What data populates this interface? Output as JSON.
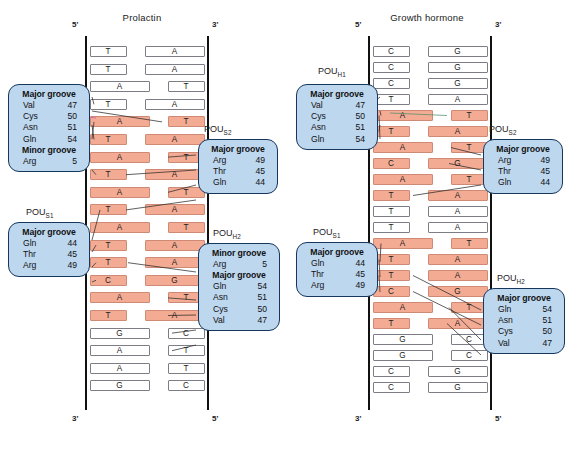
{
  "figure": {
    "panels": [
      {
        "id": "prolactin",
        "title": "Prolactin",
        "top_left_end": "5'",
        "top_right_end": "3'",
        "bottom_left_end": "3'",
        "bottom_right_end": "5'",
        "pairs": [
          {
            "left": "T",
            "right": "A",
            "highlight": false
          },
          {
            "left": "T",
            "right": "A",
            "highlight": false
          },
          {
            "left": "A",
            "right": "T",
            "highlight": false
          },
          {
            "left": "T",
            "right": "A",
            "highlight": false
          },
          {
            "left": "A",
            "right": "T",
            "highlight": true
          },
          {
            "left": "T",
            "right": "A",
            "highlight": true
          },
          {
            "left": "A",
            "right": "T",
            "highlight": true
          },
          {
            "left": "T",
            "right": "A",
            "highlight": true
          },
          {
            "left": "A",
            "right": "T",
            "highlight": true
          },
          {
            "left": "T",
            "right": "A",
            "highlight": true
          },
          {
            "left": "A",
            "right": "T",
            "highlight": true
          },
          {
            "left": "T",
            "right": "A",
            "highlight": true
          },
          {
            "left": "T",
            "right": "A",
            "highlight": true
          },
          {
            "left": "C",
            "right": "G",
            "highlight": true
          },
          {
            "left": "A",
            "right": "T",
            "highlight": true
          },
          {
            "left": "T",
            "right": "A",
            "highlight": true
          },
          {
            "left": "G",
            "right": "C",
            "highlight": false
          },
          {
            "left": "A",
            "right": "T",
            "highlight": false
          },
          {
            "left": "A",
            "right": "T",
            "highlight": false
          },
          {
            "left": "G",
            "right": "C",
            "highlight": false
          }
        ],
        "callouts": [
          {
            "id": "pou-h1",
            "name": "POU",
            "subscript": "H1",
            "show_label": false,
            "groups": [
              {
                "groove": "Major groove",
                "residues": [
                  {
                    "name": "Val",
                    "number": "47"
                  },
                  {
                    "name": "Cys",
                    "number": "50"
                  },
                  {
                    "name": "Asn",
                    "number": "51"
                  },
                  {
                    "name": "Gln",
                    "number": "54"
                  }
                ]
              },
              {
                "groove": "Minor groove",
                "residues": [
                  {
                    "name": "Arg",
                    "number": "5"
                  }
                ]
              }
            ]
          },
          {
            "id": "pou-s2",
            "name": "POU",
            "subscript": "S2",
            "show_label": true,
            "groups": [
              {
                "groove": "Major groove",
                "residues": [
                  {
                    "name": "Arg",
                    "number": "49"
                  },
                  {
                    "name": "Thr",
                    "number": "45"
                  },
                  {
                    "name": "Gln",
                    "number": "44"
                  }
                ]
              }
            ]
          },
          {
            "id": "pou-s1",
            "name": "POU",
            "subscript": "S1",
            "show_label": true,
            "groups": [
              {
                "groove": "Major groove",
                "residues": [
                  {
                    "name": "Gln",
                    "number": "44"
                  },
                  {
                    "name": "Thr",
                    "number": "45"
                  },
                  {
                    "name": "Arg",
                    "number": "49"
                  }
                ]
              }
            ]
          },
          {
            "id": "pou-h2",
            "name": "POU",
            "subscript": "H2",
            "show_label": true,
            "groups": [
              {
                "groove": "Minor groove",
                "residues": [
                  {
                    "name": "Arg",
                    "number": "5"
                  }
                ]
              },
              {
                "groove": "Major groove",
                "residues": [
                  {
                    "name": "Gln",
                    "number": "54"
                  },
                  {
                    "name": "Asn",
                    "number": "51"
                  },
                  {
                    "name": "Cys",
                    "number": "50"
                  },
                  {
                    "name": "Val",
                    "number": "47"
                  }
                ]
              }
            ]
          }
        ]
      },
      {
        "id": "growth-hormone",
        "title": "Growth hormone",
        "top_left_end": "5'",
        "top_right_end": "3'",
        "bottom_left_end": "3'",
        "bottom_right_end": "5'",
        "pairs": [
          {
            "left": "C",
            "right": "G",
            "highlight": false
          },
          {
            "left": "C",
            "right": "G",
            "highlight": false
          },
          {
            "left": "C",
            "right": "G",
            "highlight": false
          },
          {
            "left": "T",
            "right": "A",
            "highlight": false
          },
          {
            "left": "A",
            "right": "T",
            "highlight": true
          },
          {
            "left": "T",
            "right": "A",
            "highlight": true
          },
          {
            "left": "A",
            "right": "T",
            "highlight": true
          },
          {
            "left": "C",
            "right": "G",
            "highlight": true
          },
          {
            "left": "A",
            "right": "T",
            "highlight": true
          },
          {
            "left": "T",
            "right": "A",
            "highlight": true
          },
          {
            "left": "T",
            "right": "A",
            "highlight": false
          },
          {
            "left": "T",
            "right": "A",
            "highlight": false
          },
          {
            "left": "A",
            "right": "T",
            "highlight": true
          },
          {
            "left": "T",
            "right": "A",
            "highlight": true
          },
          {
            "left": "T",
            "right": "A",
            "highlight": true
          },
          {
            "left": "C",
            "right": "G",
            "highlight": true
          },
          {
            "left": "A",
            "right": "T",
            "highlight": true
          },
          {
            "left": "T",
            "right": "A",
            "highlight": true
          },
          {
            "left": "G",
            "right": "C",
            "highlight": false
          },
          {
            "left": "G",
            "right": "C",
            "highlight": false
          },
          {
            "left": "C",
            "right": "G",
            "highlight": false
          },
          {
            "left": "C",
            "right": "G",
            "highlight": false
          }
        ],
        "callouts": [
          {
            "id": "pou-h1",
            "name": "POU",
            "subscript": "H1",
            "show_label": true,
            "groups": [
              {
                "groove": "Major groove",
                "residues": [
                  {
                    "name": "Val",
                    "number": "47"
                  },
                  {
                    "name": "Cys",
                    "number": "50"
                  },
                  {
                    "name": "Asn",
                    "number": "51"
                  },
                  {
                    "name": "Gln",
                    "number": "54"
                  }
                ]
              }
            ]
          },
          {
            "id": "pou-s2",
            "name": "POU",
            "subscript": "S2",
            "show_label": true,
            "groups": [
              {
                "groove": "Major groove",
                "residues": [
                  {
                    "name": "Arg",
                    "number": "49"
                  },
                  {
                    "name": "Thr",
                    "number": "45"
                  },
                  {
                    "name": "Gln",
                    "number": "44"
                  }
                ]
              }
            ]
          },
          {
            "id": "pou-s1",
            "name": "POU",
            "subscript": "S1",
            "show_label": true,
            "groups": [
              {
                "groove": "Major groove",
                "residues": [
                  {
                    "name": "Gln",
                    "number": "44"
                  },
                  {
                    "name": "Thr",
                    "number": "45"
                  },
                  {
                    "name": "Arg",
                    "number": "49"
                  }
                ]
              }
            ]
          },
          {
            "id": "pou-h2",
            "name": "POU",
            "subscript": "H2",
            "show_label": true,
            "groups": [
              {
                "groove": "Major groove",
                "residues": [
                  {
                    "name": "Gln",
                    "number": "54"
                  },
                  {
                    "name": "Asn",
                    "number": "51"
                  },
                  {
                    "name": "Cys",
                    "number": "50"
                  },
                  {
                    "name": "Val",
                    "number": "47"
                  }
                ]
              }
            ]
          }
        ]
      }
    ],
    "colors": {
      "highlight_fill": "#f4ab93",
      "highlight_stroke": "#cf8a76",
      "callout_fill": "#bdd7ef",
      "callout_stroke": "#16365c",
      "base_stroke": "#7d7d85",
      "backbone": "#111111"
    }
  }
}
